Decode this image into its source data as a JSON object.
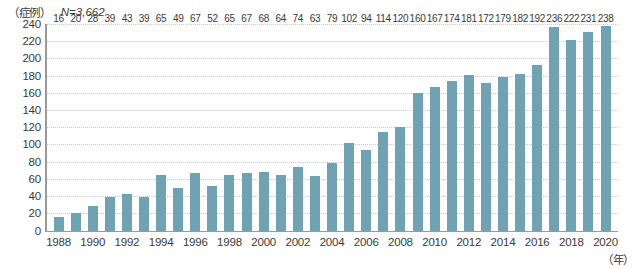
{
  "header": {
    "unit_label": "（症例）",
    "sample_size": "N=3,662"
  },
  "axes": {
    "x_unit_label": "（年）"
  },
  "chart_data": {
    "type": "bar",
    "title": "",
    "subtitle": "",
    "xlabel": "（年）",
    "ylabel": "（症例）",
    "annotations": [
      "N=3,662"
    ],
    "ylim": [
      0,
      240
    ],
    "y_ticks": [
      0,
      20,
      40,
      60,
      80,
      100,
      120,
      140,
      160,
      180,
      200,
      220,
      240
    ],
    "grid": true,
    "legend": false,
    "bar_color": "#6fa3b4",
    "axis_color": "#9a9a9a",
    "grid_color": "#c9c9c9",
    "text_color": "#3a3a3a",
    "categories": [
      "1988",
      "1989",
      "1990",
      "1991",
      "1992",
      "1993",
      "1994",
      "1995",
      "1996",
      "1997",
      "1998",
      "1999",
      "2000",
      "2001",
      "2002",
      "2003",
      "2004",
      "2005",
      "2006",
      "2007",
      "2008",
      "2009",
      "2010",
      "2011",
      "2012",
      "2013",
      "2014",
      "2015",
      "2016",
      "2017",
      "2018",
      "2019",
      "2020"
    ],
    "tick_labels": [
      "1988",
      "",
      "1990",
      "",
      "1992",
      "",
      "1994",
      "",
      "1996",
      "",
      "1998",
      "",
      "2000",
      "",
      "2002",
      "",
      "2004",
      "",
      "2006",
      "",
      "2008",
      "",
      "2010",
      "",
      "2012",
      "",
      "2014",
      "",
      "2016",
      "",
      "2018",
      "",
      "2020"
    ],
    "values": [
      16,
      20,
      28,
      39,
      43,
      39,
      65,
      49,
      67,
      52,
      65,
      67,
      68,
      64,
      74,
      63,
      79,
      102,
      94,
      114,
      120,
      160,
      167,
      174,
      181,
      172,
      179,
      182,
      192,
      236,
      222,
      231,
      238
    ]
  }
}
